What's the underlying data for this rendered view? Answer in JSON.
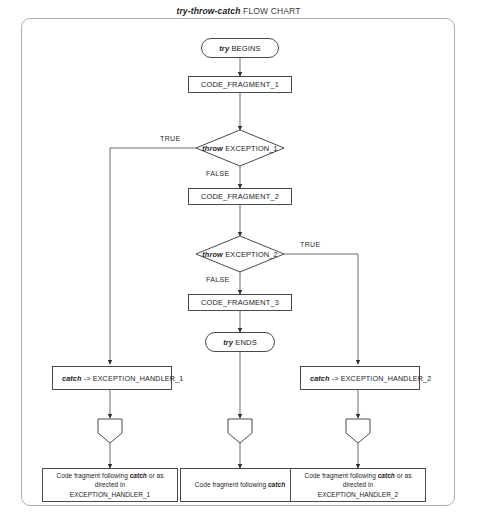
{
  "title": {
    "keyword": "try-throw-catch",
    "rest": " FLOW CHART"
  },
  "nodes": {
    "try_begins": {
      "keyword": "try",
      "rest": " BEGINS"
    },
    "code_fragment_1": {
      "label": "CODE_FRAGMENT_1"
    },
    "decision_1": {
      "keyword": "throw",
      "rest": " EXCEPTION_1"
    },
    "code_fragment_2": {
      "label": "CODE_FRAGMENT_2"
    },
    "decision_2": {
      "keyword": "throw",
      "rest": " EXCEPTION_2"
    },
    "code_fragment_3": {
      "label": "CODE_FRAGMENT_3"
    },
    "try_ends": {
      "keyword": "try",
      "rest": " ENDS"
    },
    "handler_1": {
      "keyword": "catch",
      "rest": " ->  EXCEPTION_HANDLER_1"
    },
    "handler_2": {
      "keyword": "catch",
      "rest": " ->  EXCEPTION_HANDLER_2"
    },
    "end_left": {
      "line1_pre": "Code fragment following ",
      "line1_kw": "catch",
      "line1_post": " or as",
      "line2": "directed in",
      "line3": "EXCEPTION_HANDLER_1"
    },
    "end_center": {
      "line1_pre": "Code fragment following ",
      "line1_kw": "catch",
      "line1_post": ""
    },
    "end_right": {
      "line1_pre": "Code fragment following ",
      "line1_kw": "catch",
      "line1_post": " or as",
      "line2": "directed in",
      "line3": "EXCEPTION_HANDLER_2"
    }
  },
  "edge_labels": {
    "d1_true": "TRUE",
    "d1_false": "FALSE",
    "d2_true": "TRUE",
    "d2_false": "FALSE"
  },
  "colors": {
    "stroke": "#4a4a4a",
    "frame": "#b0b0b0",
    "text": "#1c1c1c",
    "background": "#ffffff"
  }
}
